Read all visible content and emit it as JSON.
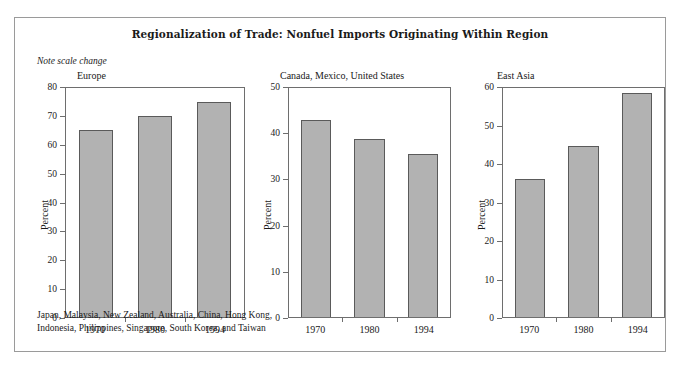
{
  "figure": {
    "title": "Regionalization of Trade: Nonfuel Imports Originating Within Region",
    "note": "Note scale change",
    "footnote": "Japan, Malaysia, New Zealand, Australia, China, Hong Kong,\nIndonesia, Philippines, Singapore, South Korea, and Taiwan",
    "bar_color": "#b2b2b2",
    "bar_edge_color": "#5a5a5a",
    "axis_color": "#6e6e6e",
    "frame_color": "#9a9a9a",
    "background": "#ffffff"
  },
  "chart_data": [
    {
      "type": "bar",
      "title": "Europe",
      "categories": [
        "1970",
        "1980",
        "1994"
      ],
      "values": [
        65.5,
        70.3,
        75.0
      ],
      "xlabel": "",
      "ylabel": "Percent",
      "ylim": [
        0,
        80
      ],
      "yticks": [
        0,
        10,
        20,
        30,
        40,
        50,
        60,
        70,
        80
      ],
      "grid": false,
      "legend": "none"
    },
    {
      "type": "bar",
      "title": "Canada, Mexico, United States",
      "categories": [
        "1970",
        "1980",
        "1994"
      ],
      "values": [
        43.0,
        38.8,
        35.5
      ],
      "xlabel": "",
      "ylabel": "Percent",
      "ylim": [
        0,
        50
      ],
      "yticks": [
        0,
        10,
        20,
        30,
        40,
        50
      ],
      "grid": false,
      "legend": "none"
    },
    {
      "type": "bar",
      "title": "East Asia",
      "categories": [
        "1970",
        "1980",
        "1994"
      ],
      "values": [
        36.2,
        44.7,
        58.7
      ],
      "xlabel": "",
      "ylabel": "Percent",
      "ylim": [
        0,
        60
      ],
      "yticks": [
        0,
        10,
        20,
        30,
        40,
        50,
        60
      ],
      "grid": false,
      "legend": "none"
    }
  ]
}
